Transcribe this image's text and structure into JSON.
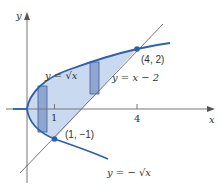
{
  "figure": {
    "axes": {
      "x_label": "x",
      "y_label": "y",
      "x_ticks": [
        {
          "value": 1,
          "label": "1"
        },
        {
          "value": 4,
          "label": "4"
        }
      ]
    },
    "curves": [
      {
        "name": "upper-root",
        "label": "y = √x",
        "equation": "y = sqrt(x)"
      },
      {
        "name": "line",
        "label": "y = x − 2",
        "equation": "y = x - 2"
      },
      {
        "name": "lower-root",
        "label": "y = − √x",
        "equation": "y = -sqrt(x)"
      }
    ],
    "points": [
      {
        "label": "(4, 2)",
        "x": 4,
        "y": 2
      },
      {
        "label": "(1, −1)",
        "x": 1,
        "y": -1
      }
    ],
    "shaded_region": "region bounded by x = y^2 and y = x - 2",
    "strips": [
      {
        "description": "vertical strip between y = -sqrt(x) and y = sqrt(x)",
        "x_approx": 0.6
      },
      {
        "description": "vertical strip between y = x - 2 and y = sqrt(x)",
        "x_approx": 2.4
      }
    ],
    "colors": {
      "curve": "#2f5fb0",
      "fill": "#c9d9f0",
      "strip": "#8fa6d0",
      "axis": "#777777",
      "line": "#666666",
      "point": "#2f5fb0"
    }
  }
}
